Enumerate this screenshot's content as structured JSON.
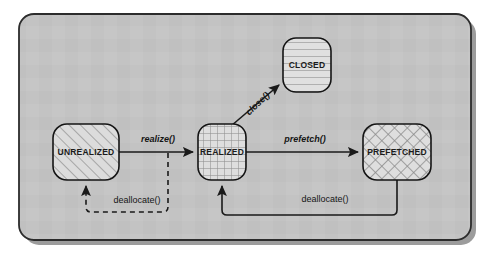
{
  "diagram": {
    "frame": {
      "fill_color": "#c2c2c2",
      "border_color": "#2b2b2b",
      "shadow_color": "#9a9a9a"
    },
    "states": [
      {
        "id": "unrealized",
        "label": "UNREALIZED",
        "fill_pattern": "diagonal-hatch",
        "fill_color": "#d8d8d8",
        "x": 53,
        "y": 124,
        "width": 66,
        "height": 56
      },
      {
        "id": "realized",
        "label": "REALIZED",
        "fill_pattern": "grid-hatch",
        "fill_color": "#d8d8d8",
        "x": 198,
        "y": 124,
        "width": 48,
        "height": 56
      },
      {
        "id": "prefetched",
        "label": "PREFETCHED",
        "fill_pattern": "diagonal-crosshatch",
        "fill_color": "#d8d8d8",
        "x": 363,
        "y": 124,
        "width": 68,
        "height": 56
      },
      {
        "id": "closed",
        "label": "CLOSED",
        "fill_pattern": "horizontal-hatch",
        "fill_color": "#dcdcdc",
        "x": 283,
        "y": 38,
        "width": 48,
        "height": 54
      }
    ],
    "transitions": [
      {
        "id": "realize",
        "label": "realize()",
        "style": "italic",
        "line": "solid",
        "from": "unrealized",
        "to": "realized",
        "label_x": 158,
        "label_y": 140
      },
      {
        "id": "prefetch",
        "label": "prefetch()",
        "style": "italic",
        "line": "solid",
        "from": "realized",
        "to": "prefetched",
        "label_x": 305,
        "label_y": 140
      },
      {
        "id": "close",
        "label": "close()",
        "style": "italic",
        "line": "solid",
        "from": "realized",
        "to": "closed",
        "label_x": 258,
        "label_y": 104,
        "rotation": -44
      },
      {
        "id": "deallocate-to-unrealized",
        "label": "deallocate()",
        "style": "plain",
        "line": "dashed",
        "from": "realize-edge",
        "to": "unrealized",
        "label_x": 137,
        "label_y": 201
      },
      {
        "id": "deallocate-to-realized",
        "label": "deallocate()",
        "style": "plain",
        "line": "solid",
        "from": "prefetched",
        "to": "realized",
        "label_x": 325,
        "label_y": 200
      }
    ]
  }
}
